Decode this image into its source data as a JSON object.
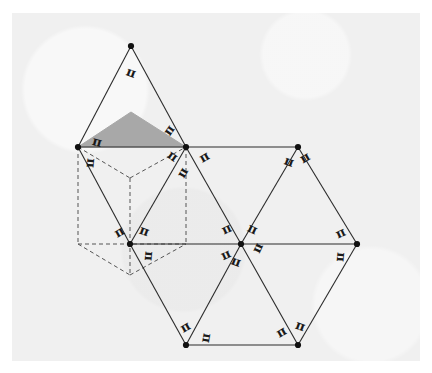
{
  "figure": {
    "title": "",
    "background_color": "#ffffff",
    "panel_color": "#f0f0f0",
    "stroke_color": "#2b2b2b",
    "shaded_fill": "#a8a8a8",
    "dashed_color": "#555555",
    "vertex_color": "#111111"
  },
  "chart_data": {
    "type": "diagram",
    "vertices": [
      {
        "id": "T",
        "name": "top-apex",
        "x": 131,
        "y": 46
      },
      {
        "id": "L",
        "name": "left",
        "x": 78,
        "y": 147
      },
      {
        "id": "M",
        "name": "upper-middle",
        "x": 186,
        "y": 147
      },
      {
        "id": "R",
        "name": "upper-right",
        "x": 298,
        "y": 147
      },
      {
        "id": "BL",
        "name": "lower-left",
        "x": 130,
        "y": 244
      },
      {
        "id": "C",
        "name": "center",
        "x": 241,
        "y": 244
      },
      {
        "id": "FR",
        "name": "far-right",
        "x": 357,
        "y": 244
      },
      {
        "id": "B1",
        "name": "bottom-left",
        "x": 186,
        "y": 345
      },
      {
        "id": "B2",
        "name": "bottom-right",
        "x": 298,
        "y": 345
      }
    ],
    "solid_edges": [
      [
        "T",
        "L"
      ],
      [
        "T",
        "M"
      ],
      [
        "L",
        "M"
      ],
      [
        "M",
        "R"
      ],
      [
        "L",
        "BL"
      ],
      [
        "M",
        "BL"
      ],
      [
        "M",
        "C"
      ],
      [
        "R",
        "C"
      ],
      [
        "R",
        "FR"
      ],
      [
        "BL",
        "C"
      ],
      [
        "C",
        "FR"
      ],
      [
        "BL",
        "B1"
      ],
      [
        "C",
        "B1"
      ],
      [
        "C",
        "B2"
      ],
      [
        "FR",
        "B2"
      ],
      [
        "B1",
        "B2"
      ]
    ],
    "dashed_cube_edges": [
      [
        [
          78,
          147
        ],
        [
          78,
          244
        ]
      ],
      [
        [
          78,
          147
        ],
        [
          130,
          178
        ]
      ],
      [
        [
          78,
          244
        ],
        [
          130,
          275
        ]
      ],
      [
        [
          130,
          178
        ],
        [
          186,
          147
        ]
      ],
      [
        [
          130,
          178
        ],
        [
          130,
          275
        ]
      ],
      [
        [
          130,
          275
        ],
        [
          186,
          244
        ]
      ],
      [
        [
          186,
          147
        ],
        [
          186,
          244
        ]
      ],
      [
        [
          78,
          244
        ],
        [
          130,
          244
        ]
      ],
      [
        [
          186,
          244
        ],
        [
          130,
          244
        ]
      ]
    ],
    "shaded_triangle": [
      [
        78,
        147
      ],
      [
        131,
        112
      ],
      [
        186,
        147
      ]
    ],
    "angle_labels": [
      {
        "symbol": "π",
        "x": 131,
        "y": 73,
        "rotation": 200
      },
      {
        "symbol": "π",
        "x": 97,
        "y": 143,
        "rotation": 15
      },
      {
        "symbol": "π",
        "x": 170,
        "y": 131,
        "rotation": -55
      },
      {
        "symbol": "π",
        "x": 172,
        "y": 157,
        "rotation": 35
      },
      {
        "symbol": "π",
        "x": 205,
        "y": 158,
        "rotation": -30
      },
      {
        "symbol": "π",
        "x": 90,
        "y": 163,
        "rotation": 95
      },
      {
        "symbol": "π",
        "x": 183,
        "y": 173,
        "rotation": 120
      },
      {
        "symbol": "π",
        "x": 289,
        "y": 162,
        "rotation": 200
      },
      {
        "symbol": "π",
        "x": 305,
        "y": 158,
        "rotation": 150
      },
      {
        "symbol": "π",
        "x": 120,
        "y": 233,
        "rotation": -30
      },
      {
        "symbol": "π",
        "x": 144,
        "y": 232,
        "rotation": 20
      },
      {
        "symbol": "π",
        "x": 148,
        "y": 256,
        "rotation": 95
      },
      {
        "symbol": "π",
        "x": 227,
        "y": 230,
        "rotation": -25
      },
      {
        "symbol": "π",
        "x": 252,
        "y": 230,
        "rotation": 25
      },
      {
        "symbol": "π",
        "x": 258,
        "y": 248,
        "rotation": 115
      },
      {
        "symbol": "π",
        "x": 236,
        "y": 262,
        "rotation": 200
      },
      {
        "symbol": "π",
        "x": 226,
        "y": 255,
        "rotation": 155
      },
      {
        "symbol": "π",
        "x": 341,
        "y": 234,
        "rotation": -25
      },
      {
        "symbol": "π",
        "x": 340,
        "y": 257,
        "rotation": 95
      },
      {
        "symbol": "π",
        "x": 186,
        "y": 328,
        "rotation": -30
      },
      {
        "symbol": "π",
        "x": 206,
        "y": 338,
        "rotation": 100
      },
      {
        "symbol": "π",
        "x": 282,
        "y": 333,
        "rotation": -30
      },
      {
        "symbol": "π",
        "x": 300,
        "y": 327,
        "rotation": 20
      }
    ]
  }
}
